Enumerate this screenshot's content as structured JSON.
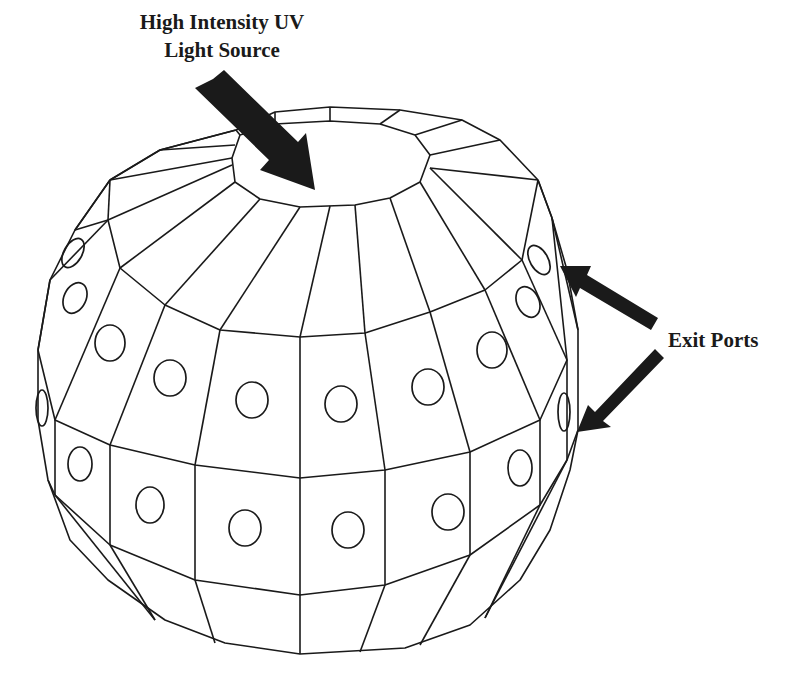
{
  "diagram": {
    "title_label": {
      "line1": "High Intensity UV",
      "line2": "Light Source"
    },
    "exit_label": "Exit Ports",
    "colors": {
      "line": "#1a1a1a",
      "background": "#ffffff"
    },
    "elements": [
      {
        "name": "polyhedral-sphere",
        "description": "Faceted spherical chamber wireframe"
      },
      {
        "name": "top-cap",
        "description": "Elliptical top opening where UV light source enters"
      },
      {
        "name": "uv-arrow",
        "description": "Arrow pointing from label to top cap"
      },
      {
        "name": "exit-port-arrow-upper",
        "description": "Arrow pointing to upper exit port"
      },
      {
        "name": "exit-port-arrow-lower",
        "description": "Arrow pointing to lower exit port"
      }
    ],
    "port_rows": [
      {
        "row": "upper",
        "count_visible": 9
      },
      {
        "row": "lower",
        "count_visible": 9
      }
    ]
  }
}
